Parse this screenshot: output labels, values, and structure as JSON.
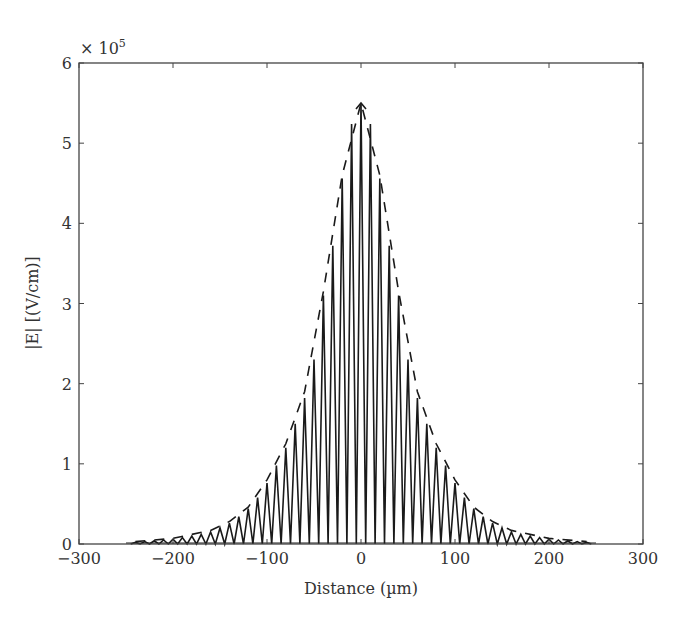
{
  "chart_data": {
    "type": "line",
    "title": "",
    "xlabel": "Distance (µm)",
    "ylabel": "|E| [(V/cm)]",
    "y_multiplier_label": "× 10",
    "y_multiplier_exponent": "5",
    "xlim": [
      -300,
      300
    ],
    "ylim": [
      0,
      6
    ],
    "y_scale_factor": 100000,
    "xticks": [
      -300,
      -200,
      -100,
      0,
      100,
      200,
      300
    ],
    "xtick_labels": [
      "−300",
      "−200",
      "−100",
      "0",
      "100",
      "200",
      "300"
    ],
    "yticks": [
      0,
      1,
      2,
      3,
      4,
      5,
      6
    ],
    "ytick_labels": [
      "0",
      "1",
      "2",
      "3",
      "4",
      "5",
      "6"
    ],
    "grid": false,
    "legend": null,
    "series": [
      {
        "name": "|E| oscillating field",
        "style": "solid",
        "description": "Spike train with ~10 µm period; peaks bounded by envelope",
        "period_um": 10,
        "x_range": [
          -250,
          250
        ],
        "peaks": {
          "x": [
            -240,
            -230,
            -220,
            -210,
            -200,
            -190,
            -180,
            -170,
            -160,
            -150,
            -140,
            -130,
            -120,
            -110,
            -100,
            -90,
            -80,
            -70,
            -60,
            -50,
            -40,
            -30,
            -20,
            -10,
            0,
            10,
            20,
            30,
            40,
            50,
            60,
            70,
            80,
            90,
            100,
            110,
            120,
            130,
            140,
            150,
            160,
            170,
            180,
            190,
            200,
            210,
            220,
            230,
            240
          ],
          "y": [
            0.02,
            0.03,
            0.04,
            0.05,
            0.06,
            0.08,
            0.1,
            0.12,
            0.15,
            0.2,
            0.26,
            0.34,
            0.44,
            0.58,
            0.76,
            0.98,
            1.2,
            1.5,
            1.82,
            2.3,
            3.1,
            3.72,
            4.56,
            5.24,
            5.5,
            5.24,
            4.56,
            3.72,
            3.1,
            2.3,
            1.82,
            1.5,
            1.2,
            0.98,
            0.76,
            0.58,
            0.44,
            0.34,
            0.26,
            0.2,
            0.15,
            0.12,
            0.1,
            0.08,
            0.06,
            0.05,
            0.04,
            0.03,
            0.02
          ]
        }
      },
      {
        "name": "envelope",
        "style": "dashed",
        "x": [
          -240,
          -200,
          -160,
          -140,
          -120,
          -100,
          -80,
          -60,
          -40,
          -20,
          0,
          20,
          40,
          60,
          80,
          100,
          120,
          140,
          160,
          200,
          240
        ],
        "y": [
          0.03,
          0.07,
          0.17,
          0.28,
          0.46,
          0.8,
          1.25,
          1.9,
          3.15,
          4.6,
          5.5,
          4.6,
          3.15,
          1.9,
          1.25,
          0.8,
          0.46,
          0.28,
          0.17,
          0.07,
          0.03
        ]
      }
    ]
  }
}
